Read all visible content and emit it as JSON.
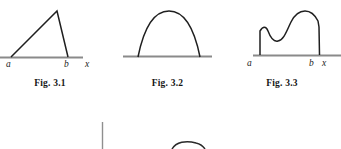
{
  "page": {
    "background": "#ffffff",
    "curve_color": "#1f1f1f",
    "axis_color": "#8a8a8a"
  },
  "figures": [
    {
      "id": "fig-3-1",
      "caption": "Fig. 3.1",
      "shape_name": "triangle-region",
      "labels": {
        "left": "a",
        "right": "b",
        "axis": "x"
      }
    },
    {
      "id": "fig-3-2",
      "caption": "Fig. 3.2",
      "shape_name": "parabolic-arch-region",
      "labels": {
        "left": "a",
        "right": "b",
        "axis": "x"
      }
    },
    {
      "id": "fig-3-3",
      "caption": "Fig. 3.3",
      "shape_name": "irregular-curve-region",
      "labels": {
        "left": "a",
        "right": "b",
        "axis": "x"
      }
    }
  ],
  "bottom_partial": {
    "name": "cut-off-next-figure-row",
    "elements": [
      "vertical-rule",
      "small-arc"
    ]
  }
}
